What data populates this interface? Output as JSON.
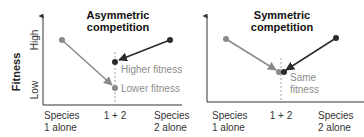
{
  "y_axis": {
    "title": "Fitness",
    "high_label": "High",
    "low_label": "Low"
  },
  "panels": [
    {
      "title_line1": "Asymmetric",
      "title_line2": "competition",
      "x_labels": [
        {
          "line1": "Species",
          "line2": "1 alone"
        },
        {
          "line1": "1 + 2",
          "line2": ""
        },
        {
          "line1": "Species",
          "line2": "2 alone"
        }
      ],
      "annotations": [
        "Higher fitness",
        "Lower fitness"
      ]
    },
    {
      "title_line1": "Symmetric",
      "title_line2": "competition",
      "x_labels": [
        {
          "line1": "Species",
          "line2": "1 alone"
        },
        {
          "line1": "1 + 2",
          "line2": ""
        },
        {
          "line1": "Species",
          "line2": "2 alone"
        }
      ],
      "annotations": [
        "Same",
        "fitness"
      ]
    }
  ],
  "colors": {
    "species1": "#8a8a8a",
    "species2": "#2b2b2b",
    "axis": "#333333",
    "annotation": "#8c8c8c"
  }
}
